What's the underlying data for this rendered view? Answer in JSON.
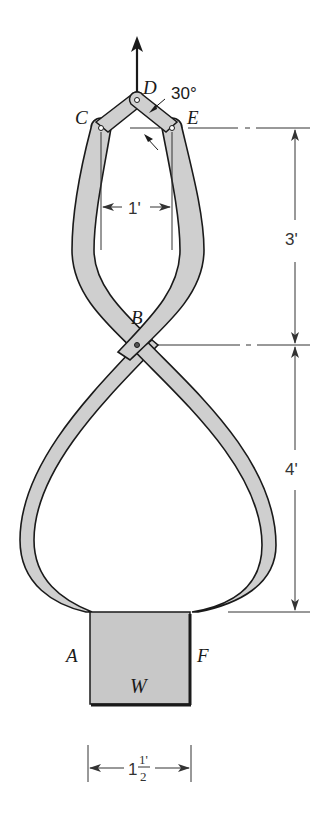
{
  "figure": {
    "type": "tongs-lifting-mechanism",
    "points": {
      "A": "A",
      "B": "B",
      "C": "C",
      "D": "D",
      "E": "E",
      "F": "F"
    },
    "load_label": "W",
    "angle_label": "30°",
    "dimensions": {
      "pin_spacing": "1'",
      "upper_height": "3'",
      "lower_height": "4'",
      "block_width_whole": "1",
      "block_width_num": "1'",
      "block_width_den": "2"
    },
    "colors": {
      "member_fill": "#cfcfcf",
      "outline": "#1a1a1a",
      "block_fill": "#c8c8c8",
      "dimension_line": "#333333",
      "background": "#ffffff"
    }
  }
}
